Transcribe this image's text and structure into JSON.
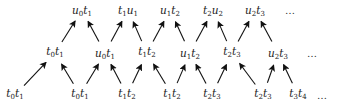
{
  "diagram": {
    "type": "lattice-arrow-diagram",
    "rows": {
      "top": [
        {
          "id": "T0",
          "base1": "u",
          "sub1": "0",
          "base2": "t",
          "sub2": "1",
          "x": 82
        },
        {
          "id": "T1",
          "base1": "t",
          "sub1": "1",
          "base2": "u",
          "sub2": "1",
          "x": 128
        },
        {
          "id": "T2",
          "base1": "u",
          "sub1": "1",
          "base2": "t",
          "sub2": "2",
          "x": 170
        },
        {
          "id": "T3",
          "base1": "t",
          "sub1": "2",
          "base2": "u",
          "sub2": "2",
          "x": 213
        },
        {
          "id": "T4",
          "base1": "u",
          "sub1": "2",
          "base2": "t",
          "sub2": "3",
          "x": 255
        }
      ],
      "middle": [
        {
          "id": "M0",
          "base1": "t",
          "sub1": "0",
          "base2": "t",
          "sub2": "1",
          "x": 55
        },
        {
          "id": "M1",
          "base1": "u",
          "sub1": "0",
          "base2": "t",
          "sub2": "1",
          "x": 105
        },
        {
          "id": "M2",
          "base1": "t",
          "sub1": "1",
          "base2": "t",
          "sub2": "2",
          "x": 147
        },
        {
          "id": "M3",
          "base1": "u",
          "sub1": "1",
          "base2": "t",
          "sub2": "2",
          "x": 190
        },
        {
          "id": "M4",
          "base1": "t",
          "sub1": "2",
          "base2": "t",
          "sub2": "3",
          "x": 232
        },
        {
          "id": "M5",
          "base1": "u",
          "sub1": "2",
          "base2": "t",
          "sub2": "3",
          "x": 278
        }
      ],
      "bottom": [
        {
          "id": "B0",
          "base1": "t",
          "sub1": "0",
          "base2": "t",
          "sub2": "1",
          "x": 15
        },
        {
          "id": "B1",
          "base1": "t",
          "sub1": "0",
          "base2": "t",
          "sub2": "1",
          "x": 80
        },
        {
          "id": "B2",
          "base1": "t",
          "sub1": "1",
          "base2": "t",
          "sub2": "2",
          "x": 127
        },
        {
          "id": "B3",
          "base1": "t",
          "sub1": "1",
          "base2": "t",
          "sub2": "2",
          "x": 172
        },
        {
          "id": "B4",
          "base1": "t",
          "sub1": "2",
          "base2": "t",
          "sub2": "3",
          "x": 212
        },
        {
          "id": "B5",
          "base1": "t",
          "sub1": "2",
          "base2": "t",
          "sub2": "3",
          "x": 263
        },
        {
          "id": "B6",
          "base1": "t",
          "sub1": "3",
          "base2": "t",
          "sub2": "4",
          "x": 298
        }
      ]
    },
    "ellipsis": {
      "top": {
        "text": "…",
        "x": 290
      },
      "middle": {
        "text": "…",
        "x": 312
      },
      "bottom": {
        "text": "…",
        "x": 322
      }
    },
    "edges": [
      [
        "B0",
        "M0"
      ],
      [
        "B1",
        "M0"
      ],
      [
        "B1",
        "M1"
      ],
      [
        "B2",
        "M1"
      ],
      [
        "B2",
        "M2"
      ],
      [
        "B3",
        "M2"
      ],
      [
        "B3",
        "M3"
      ],
      [
        "B4",
        "M3"
      ],
      [
        "B4",
        "M4"
      ],
      [
        "B5",
        "M4"
      ],
      [
        "B5",
        "M5"
      ],
      [
        "B6",
        "M5"
      ],
      [
        "M0",
        "T0"
      ],
      [
        "M1",
        "T0"
      ],
      [
        "M1",
        "T1"
      ],
      [
        "M2",
        "T1"
      ],
      [
        "M2",
        "T2"
      ],
      [
        "M3",
        "T2"
      ],
      [
        "M3",
        "T3"
      ],
      [
        "M4",
        "T3"
      ],
      [
        "M4",
        "T4"
      ],
      [
        "M5",
        "T4"
      ]
    ],
    "row_y": {
      "top": 14,
      "middle": 57,
      "bottom": 99
    },
    "colors": {
      "label": "#222222",
      "arrow": "#111111",
      "background": "#ffffff"
    }
  }
}
